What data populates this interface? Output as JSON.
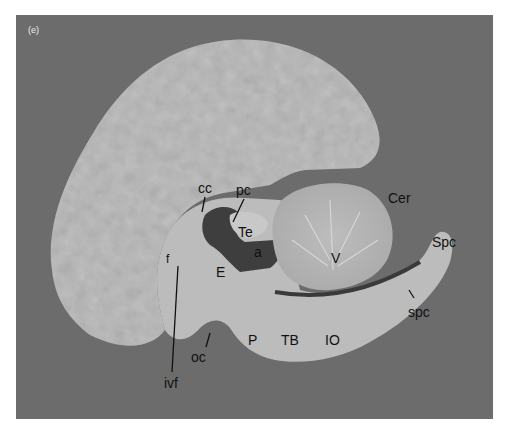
{
  "figure": {
    "panel_label": "(e)",
    "colors": {
      "background": "#6c6c6c",
      "tissue": "#b8b8b8",
      "ventricle": "#3c3c3c",
      "label": "#111111"
    },
    "labels": [
      {
        "id": "cc",
        "text": "cc",
        "x": 198,
        "y": 181
      },
      {
        "id": "pc",
        "text": "pc",
        "x": 236,
        "y": 183
      },
      {
        "id": "Te",
        "text": "Te",
        "x": 238,
        "y": 225
      },
      {
        "id": "a",
        "text": "a",
        "x": 254,
        "y": 245
      },
      {
        "id": "E",
        "text": "E",
        "x": 216,
        "y": 265
      },
      {
        "id": "f",
        "text": "f",
        "x": 166,
        "y": 252
      },
      {
        "id": "V",
        "text": "V",
        "x": 331,
        "y": 251
      },
      {
        "id": "Cer",
        "text": "Cer",
        "x": 388,
        "y": 191
      },
      {
        "id": "Spc",
        "text": "Spc",
        "x": 432,
        "y": 235
      },
      {
        "id": "spc",
        "text": "spc",
        "x": 408,
        "y": 305
      },
      {
        "id": "P",
        "text": "P",
        "x": 248,
        "y": 333
      },
      {
        "id": "TB",
        "text": "TB",
        "x": 281,
        "y": 333
      },
      {
        "id": "IO",
        "text": "IO",
        "x": 325,
        "y": 333
      },
      {
        "id": "oc",
        "text": "oc",
        "x": 191,
        "y": 350
      },
      {
        "id": "ivf",
        "text": "ivf",
        "x": 164,
        "y": 376
      }
    ]
  }
}
